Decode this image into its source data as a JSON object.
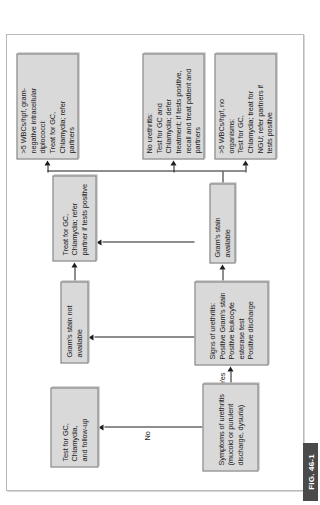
{
  "figure": {
    "caption_tab": "FIG. 46-1",
    "orientation": "rotated-90-ccw"
  },
  "colors": {
    "box_fill": "#d9d9d9",
    "box_border": "#7d7d7d",
    "connector": "#1c1c1c",
    "frame": "#b9b9b9",
    "tab_background": "#4a4a4a",
    "tab_text": "#ffffff"
  },
  "nodes": {
    "symptoms": "Symptoms of urethritis\n(mucoid or purulent\ndischarge, dysuria)",
    "test_followup": "Test for GC, Chlamydia,\nand follow-up",
    "signs": "Signs of urethritis:\nPositive Gram's stain\nPositive leukocyte\nesterase test\nPositive discharge",
    "stain_not_available": "Gram's stain not available",
    "treat_refer_partner": "Treat for GC, Chlamydia; refer\npartner if tests positive",
    "stain_available": "Gram's stain available",
    "no_urethritis": "No urethritis:\nTest for GC and\nChlamydia; defer\ntreatment; if tests positive,\nrecall and treat patient and\npartners",
    "wbc_no_organisms": ">5 WBCs/hpf, no\norganisms:\nTest for GC,\nChlamydia; treat for\nNGU; refer partners if\ntests positive",
    "wbc_diplococci": ">5 WBCs/hpf, gram-\nnegative intracellular\ndiplococci:\nTreat for GC,\nChlamydia; refer\npartners"
  },
  "edge_labels": {
    "no": "No",
    "yes": "Yes"
  }
}
